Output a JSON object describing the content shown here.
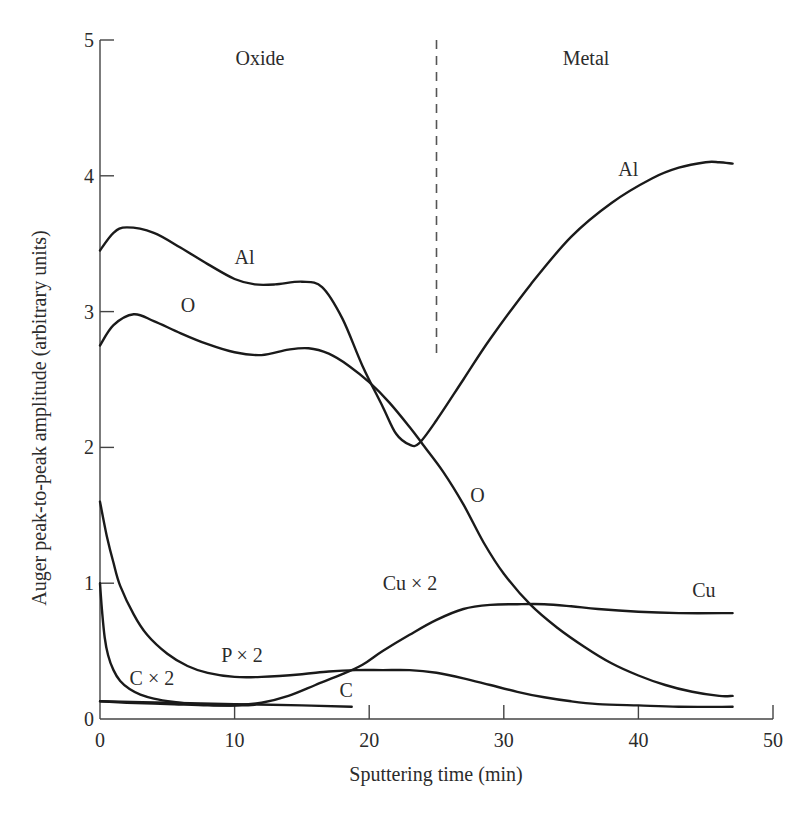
{
  "chart_data": {
    "type": "line",
    "title": "",
    "xlabel": "Sputtering time (min)",
    "ylabel": "Auger peak-to-peak amplitude (arbitrary units)",
    "xlim": [
      0,
      50
    ],
    "ylim": [
      0,
      5
    ],
    "xticks": [
      0,
      10,
      20,
      30,
      40,
      50
    ],
    "yticks": [
      0,
      1,
      2,
      3,
      4,
      5
    ],
    "xtick_labels": [
      "0",
      "10",
      "20",
      "30",
      "40",
      "50"
    ],
    "ytick_labels": [
      "0",
      "1",
      "2",
      "3",
      "4",
      "5"
    ],
    "grid": false,
    "legend": "inline labels",
    "regions": [
      {
        "label": "Oxide",
        "x_range": [
          0,
          25
        ]
      },
      {
        "label": "Metal",
        "x_range": [
          25,
          50
        ]
      }
    ],
    "divider": {
      "x": 25,
      "y_range": [
        2.65,
        5.0
      ],
      "style": "dashed"
    },
    "series": [
      {
        "name": "Al",
        "labels": [
          {
            "text": "Al",
            "x": 10,
            "y": 3.35
          },
          {
            "text": "Al",
            "x": 38.5,
            "y": 4.0
          }
        ],
        "x": [
          0,
          1,
          2,
          4,
          6,
          8,
          10,
          11.5,
          13,
          15,
          16.5,
          18,
          19.5,
          21,
          22,
          23,
          23.7,
          25,
          27,
          29,
          32,
          35,
          38,
          41,
          43,
          45,
          46,
          47
        ],
        "values": [
          3.45,
          3.58,
          3.62,
          3.58,
          3.47,
          3.35,
          3.24,
          3.2,
          3.2,
          3.22,
          3.18,
          2.95,
          2.6,
          2.3,
          2.1,
          2.02,
          2.03,
          2.2,
          2.5,
          2.8,
          3.2,
          3.55,
          3.8,
          3.98,
          4.06,
          4.1,
          4.1,
          4.09
        ]
      },
      {
        "name": "O",
        "labels": [
          {
            "text": "O",
            "x": 6,
            "y": 3.0
          },
          {
            "text": "O",
            "x": 27.5,
            "y": 1.6
          }
        ],
        "x": [
          0,
          1,
          2.5,
          4,
          6,
          8,
          10,
          12,
          14,
          15.5,
          17,
          18.5,
          20,
          21.5,
          23,
          24,
          25.5,
          27,
          28.5,
          30,
          32,
          34,
          36,
          38,
          40,
          42,
          44,
          46,
          47
        ],
        "values": [
          2.75,
          2.9,
          2.98,
          2.93,
          2.84,
          2.76,
          2.7,
          2.68,
          2.72,
          2.73,
          2.69,
          2.6,
          2.48,
          2.33,
          2.15,
          2.02,
          1.82,
          1.58,
          1.3,
          1.07,
          0.84,
          0.67,
          0.53,
          0.41,
          0.32,
          0.25,
          0.2,
          0.17,
          0.17
        ]
      },
      {
        "name": "Cu × 2 / Cu",
        "labels": [
          {
            "text": "Cu × 2",
            "x": 21,
            "y": 0.95
          },
          {
            "text": "Cu",
            "x": 44,
            "y": 0.9
          }
        ],
        "x": [
          0,
          2,
          5,
          8,
          10,
          12,
          14,
          16,
          18,
          19.5,
          21,
          23,
          25,
          27,
          29,
          31,
          33,
          35,
          37,
          40,
          43,
          47
        ],
        "values": [
          0.13,
          0.12,
          0.11,
          0.1,
          0.1,
          0.12,
          0.17,
          0.25,
          0.33,
          0.4,
          0.5,
          0.62,
          0.73,
          0.81,
          0.84,
          0.845,
          0.845,
          0.83,
          0.81,
          0.79,
          0.78,
          0.78
        ]
      },
      {
        "name": "P × 2",
        "labels": [
          {
            "text": "P × 2",
            "x": 9,
            "y": 0.42
          }
        ],
        "x": [
          0,
          0.5,
          1,
          1.5,
          2.5,
          3.5,
          5,
          6.5,
          8,
          10,
          12,
          15,
          17,
          19,
          21,
          23,
          25,
          27,
          29,
          31,
          33,
          35,
          37,
          40,
          43,
          47
        ],
        "values": [
          1.6,
          1.35,
          1.15,
          0.98,
          0.77,
          0.62,
          0.48,
          0.39,
          0.34,
          0.31,
          0.31,
          0.33,
          0.35,
          0.36,
          0.36,
          0.36,
          0.34,
          0.3,
          0.25,
          0.2,
          0.16,
          0.13,
          0.11,
          0.1,
          0.09,
          0.09
        ]
      },
      {
        "name": "C × 2",
        "labels": [
          {
            "text": "C × 2",
            "x": 2.2,
            "y": 0.25
          }
        ],
        "x": [
          0,
          0.15,
          0.35,
          0.6,
          1,
          1.5,
          2.2,
          3,
          4,
          5.5,
          7,
          9,
          10.5,
          11.5
        ],
        "values": [
          1.0,
          0.8,
          0.6,
          0.47,
          0.36,
          0.28,
          0.22,
          0.18,
          0.15,
          0.125,
          0.11,
          0.1,
          0.1,
          0.105
        ]
      },
      {
        "name": "C",
        "labels": [
          {
            "text": "C",
            "x": 17.8,
            "y": 0.16
          }
        ],
        "x": [
          0,
          5,
          10,
          15,
          18.7
        ],
        "values": [
          0.13,
          0.12,
          0.11,
          0.1,
          0.09
        ]
      }
    ]
  }
}
